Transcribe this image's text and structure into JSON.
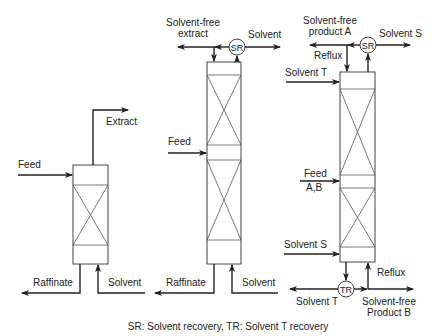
{
  "diagram": {
    "caption": "SR: Solvent recovery, TR: Solvent T recovery",
    "colors": {
      "line": "#222222",
      "background": "#ffffff"
    },
    "columns": [
      {
        "id": "simple-extractor",
        "labels": {
          "feed": "Feed",
          "extract": "Extract",
          "raffinate": "Raffinate",
          "solvent": "Solvent"
        }
      },
      {
        "id": "extractor-with-reflux",
        "labels": {
          "solvent_free_extract_line1": "Solvent-free",
          "solvent_free_extract_line2": "extract",
          "sr": "SR",
          "solvent_top": "Solvent",
          "feed": "Feed",
          "raffinate": "Raffinate",
          "solvent_bottom": "Solvent"
        }
      },
      {
        "id": "fractional-extractor",
        "labels": {
          "product_a_line1": "Solvent-free",
          "product_a_line2": "product A",
          "sr": "SR",
          "solvent_s_top": "Solvent S",
          "reflux_top": "Reflux",
          "solvent_t_top": "Solvent T",
          "feed_line1": "Feed",
          "feed_line2": "A,B",
          "solvent_s_bottom": "Solvent S",
          "tr": "TR",
          "reflux_bottom": "Reflux",
          "solvent_t_bottom": "Solvent T",
          "product_b_line1": "Solvent-free",
          "product_b_line2": "Product B"
        }
      }
    ]
  }
}
